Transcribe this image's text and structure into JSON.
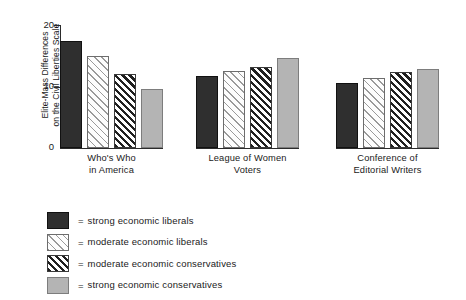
{
  "chart_data": {
    "type": "bar",
    "title": "",
    "xlabel": "",
    "ylabel": "Elite-Mass Differences on the Civil Liberties Scale",
    "ylabel_lines": [
      "Elite-Mass Differences",
      "on the Civil Liberties Scale"
    ],
    "ylim": [
      0,
      20
    ],
    "yticks": [
      0,
      10,
      20
    ],
    "ytick_labels": [
      "0",
      "10",
      "20"
    ],
    "grid": false,
    "legend_position": "below",
    "categories": [
      "Who's Who in America",
      "League of Women Voters",
      "Conference of Editorial Writers"
    ],
    "category_lines": [
      [
        "Who's Who",
        "in America"
      ],
      [
        "League of Women",
        "Voters"
      ],
      [
        "Conference of",
        "Editorial Writers"
      ]
    ],
    "series": [
      {
        "name": "strong economic liberals",
        "values": [
          17.4,
          11.7,
          10.6
        ],
        "color": "#2f2f2f",
        "pattern": "solid-dark"
      },
      {
        "name": "moderate economic liberals",
        "values": [
          15.0,
          12.5,
          11.4
        ],
        "color": "#fdfdfd",
        "pattern": "light-diagonal-hatch"
      },
      {
        "name": "moderate economic conservatives",
        "values": [
          12.0,
          13.2,
          12.3
        ],
        "color": "#fdfdfd",
        "pattern": "dense-diagonal-hatch"
      },
      {
        "name": "strong economic conservatives",
        "values": [
          9.6,
          14.6,
          12.8
        ],
        "color": "#b4b4b4",
        "pattern": "solid-gray"
      }
    ]
  },
  "legend": {
    "equals": "=",
    "entries": [
      {
        "label": "strong economic liberals"
      },
      {
        "label": "moderate economic liberals"
      },
      {
        "label": "moderate economic conservatives"
      },
      {
        "label": "strong economic conservatives"
      }
    ]
  }
}
